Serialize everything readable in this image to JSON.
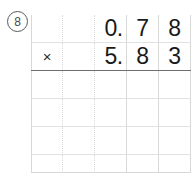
{
  "problem": {
    "number_label": "8",
    "number_circled": true,
    "operation": "multiplication",
    "operator_symbol": "×",
    "multiplicand": "0.78",
    "multiplier": "5.83",
    "answer": "",
    "answer_blank": true
  },
  "grid": {
    "columns": 5,
    "rows": 6,
    "rule_after_row": 2,
    "line_color": "#d8d8d8",
    "rule_color": "#6e6e6e",
    "text_color": "#1a1a1a"
  },
  "cells": {
    "row1": [
      "",
      "",
      "0.",
      "7",
      "8"
    ],
    "row2": [
      "×",
      "",
      "5.",
      "8",
      "3"
    ],
    "row3": [
      "",
      "",
      "",
      "",
      ""
    ],
    "row4": [
      "",
      "",
      "",
      "",
      ""
    ],
    "row5": [
      "",
      "",
      "",
      "",
      ""
    ],
    "row6": [
      "",
      "",
      "",
      "",
      ""
    ]
  }
}
